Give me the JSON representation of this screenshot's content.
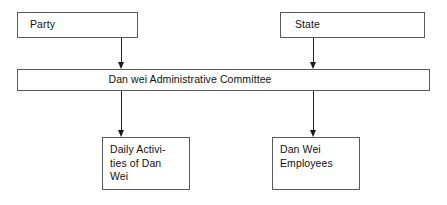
{
  "diagram": {
    "background_color": "#ffffff",
    "line_color": "#222222",
    "box_border_color": "#5a5a5a",
    "text_color": "#111111",
    "nodes": [
      {
        "id": "party",
        "label": "Party",
        "align": "left"
      },
      {
        "id": "state",
        "label": "State",
        "align": "left"
      },
      {
        "id": "committee",
        "label": "Dan wei Administrative Committee",
        "align": "center"
      },
      {
        "id": "daily",
        "label": "Daily Activi-\nties of Dan\nWei",
        "align": "left"
      },
      {
        "id": "employees",
        "label": "Dan Wei\nEmployees",
        "align": "left"
      }
    ],
    "edges": [
      {
        "id": "party-to-committee",
        "from": "party",
        "to": "committee",
        "marker": "arrow-down"
      },
      {
        "id": "state-to-committee",
        "from": "state",
        "to": "committee",
        "marker": "arrow-down"
      },
      {
        "id": "committee-to-daily",
        "from": "committee",
        "to": "daily",
        "marker": "arrow-down"
      },
      {
        "id": "committee-to-employees",
        "from": "committee",
        "to": "employees",
        "marker": "arrow-down"
      }
    ]
  }
}
